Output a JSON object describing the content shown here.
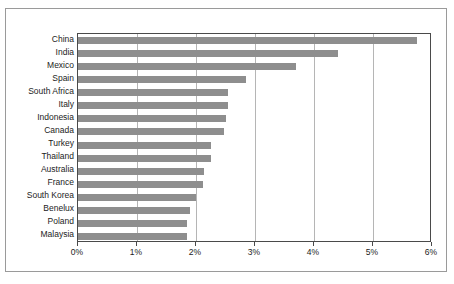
{
  "chart_data": {
    "type": "bar",
    "orientation": "horizontal",
    "title": "",
    "subtitle": "",
    "xlabel": "",
    "ylabel": "",
    "xlim": [
      0,
      6
    ],
    "xtick_values": [
      0,
      1,
      2,
      3,
      4,
      5,
      6
    ],
    "xtick_labels": [
      "0%",
      "1%",
      "2%",
      "3%",
      "4%",
      "5%",
      "6%"
    ],
    "grid": true,
    "grid_axis": "x",
    "legend": false,
    "legend_position": "none",
    "value_unit": "%",
    "categories": [
      "China",
      "India",
      "Mexico",
      "Spain",
      "South Africa",
      "Italy",
      "Indonesia",
      "Canada",
      "Turkey",
      "Thailand",
      "Australia",
      "France",
      "South Korea",
      "Benelux",
      "Poland",
      "Malaysia"
    ],
    "values": [
      5.75,
      4.4,
      3.7,
      2.85,
      2.55,
      2.54,
      2.5,
      2.48,
      2.25,
      2.25,
      2.13,
      2.12,
      2.0,
      1.9,
      1.85,
      1.85
    ],
    "series": [
      {
        "name": "Share",
        "color": "#8e8e8e",
        "values": [
          5.75,
          4.4,
          3.7,
          2.85,
          2.55,
          2.54,
          2.5,
          2.48,
          2.25,
          2.25,
          2.13,
          2.12,
          2.0,
          1.9,
          1.85,
          1.85
        ]
      }
    ]
  },
  "style": {
    "bar_color": "#8e8e8e",
    "grid_color": "#b5b5b5",
    "axis_color": "#4a4a4a",
    "frame_color": "#9a9a9a",
    "text_color": "#1c1c1c",
    "background": "#ffffff"
  }
}
